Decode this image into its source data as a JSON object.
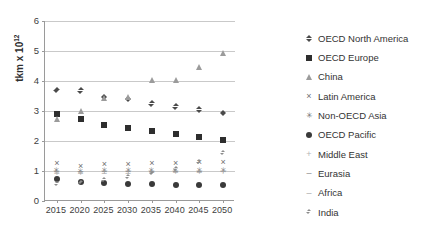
{
  "chart_data": {
    "type": "scatter",
    "title": "",
    "xlabel": "",
    "ylabel": "tkm  x 10",
    "ylabel_exponent": "12",
    "x": [
      2015,
      2020,
      2025,
      2030,
      2035,
      2040,
      2045,
      2050
    ],
    "xtick_labels": [
      "2015",
      "2020",
      "2025",
      "2030",
      "2035",
      "2040",
      "2045",
      "2050"
    ],
    "ytick_labels": [
      "0",
      "1",
      "2",
      "3",
      "4",
      "5",
      "6"
    ],
    "ylim": [
      0,
      6
    ],
    "ytick_values": [
      0,
      1,
      2,
      3,
      4,
      5,
      6
    ],
    "grid": true,
    "legend_position": "right",
    "series": [
      {
        "name": "OECD North America",
        "marker": "diamond",
        "color": "#4a4a4a",
        "values": [
          3.7,
          3.68,
          3.47,
          3.4,
          3.25,
          3.15,
          3.05,
          2.92
        ]
      },
      {
        "name": "OECD Europe",
        "marker": "square",
        "color": "#2e2e2e",
        "values": [
          2.9,
          2.72,
          2.55,
          2.42,
          2.32,
          2.25,
          2.15,
          2.05
        ]
      },
      {
        "name": "China",
        "marker": "triangle",
        "color": "#9b9b9b",
        "values": [
          2.75,
          3.0,
          3.45,
          3.48,
          4.02,
          4.05,
          4.48,
          4.92
        ]
      },
      {
        "name": "Latin America",
        "marker": "x",
        "color": "#6f6f6f",
        "values": [
          1.28,
          1.18,
          1.22,
          1.25,
          1.26,
          1.28,
          1.3,
          1.3
        ]
      },
      {
        "name": "Non-OECD Asia",
        "marker": "star",
        "color": "#6f6f6f",
        "values": [
          1.02,
          1.0,
          1.02,
          1.02,
          1.02,
          1.02,
          1.04,
          1.05
        ]
      },
      {
        "name": "OECD Pacific",
        "marker": "circle",
        "color": "#3a3a3a",
        "values": [
          0.72,
          0.64,
          0.6,
          0.58,
          0.56,
          0.55,
          0.54,
          0.53
        ]
      },
      {
        "name": "Middle East",
        "marker": "plus",
        "color": "#b4b4b4",
        "values": [
          0.95,
          0.95,
          0.96,
          0.96,
          0.97,
          0.97,
          0.98,
          0.98
        ]
      },
      {
        "name": "Eurasia",
        "marker": "dash",
        "color": "#8a8a8a",
        "values": [
          1.0,
          1.0,
          1.0,
          1.0,
          1.0,
          1.0,
          1.0,
          1.0
        ]
      },
      {
        "name": "Africa",
        "marker": "hyphen",
        "color": "#a8a8a8",
        "values": [
          0.92,
          0.93,
          0.94,
          0.95,
          0.96,
          0.97,
          0.98,
          0.99
        ]
      },
      {
        "name": "India",
        "marker": "diamond-small",
        "color": "#8d8d8d",
        "values": [
          0.56,
          0.62,
          0.7,
          0.8,
          0.92,
          1.08,
          1.3,
          1.6
        ]
      }
    ]
  }
}
